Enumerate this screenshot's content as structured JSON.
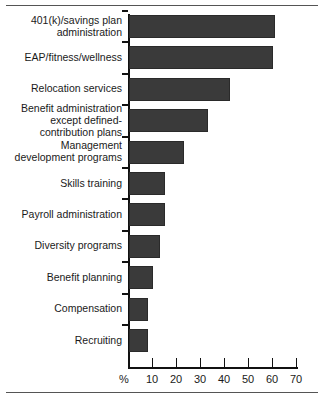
{
  "chart_data": {
    "type": "bar",
    "orientation": "horizontal",
    "title": "",
    "subtitle": "",
    "xlabel": "%",
    "ylabel": "",
    "xlim": [
      0,
      70
    ],
    "grid": false,
    "legend": null,
    "axis_unit_label": "%",
    "xticks": [
      10,
      20,
      30,
      40,
      50,
      60,
      70
    ],
    "xticklabels": [
      "10",
      "20",
      "30",
      "40",
      "50",
      "60",
      "70"
    ],
    "categories": [
      "401(k)/savings plan\nadministration",
      "EAP/fitness/wellness",
      "Relocation services",
      "Benefit administration\nexcept defined-\ncontribution plans",
      "Management\ndevelopment programs",
      "Skills training",
      "Payroll administration",
      "Diversity programs",
      "Benefit planning",
      "Compensation",
      "Recruiting"
    ],
    "values": [
      61,
      60,
      42,
      33,
      23,
      15,
      15,
      13,
      10,
      8,
      8
    ],
    "bar_color": "#3a3a3a",
    "bar_edge_color": "#2a2a2a",
    "axis_color": "#111111",
    "text_color": "#1a1a1a",
    "rule_color": "#555555"
  }
}
